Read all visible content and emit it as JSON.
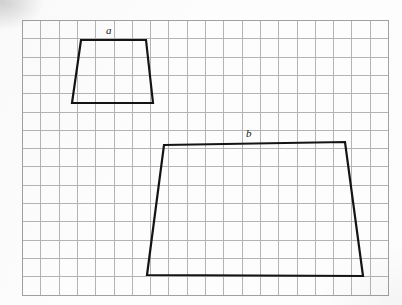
{
  "figure": {
    "background_color": "#fdfdfd",
    "grid": {
      "line_color": "#b4b4b4",
      "border_color": "#a0a0a0",
      "origin_x": 22,
      "origin_y": 20,
      "cell_size": 18.3,
      "columns": 20,
      "rows": 15
    },
    "stroke_color": "#141414",
    "stroke_width": 2.2,
    "shapes": [
      {
        "label": "a",
        "name": "small-trapezoid",
        "type": "trapezoid",
        "label_x": 106,
        "label_y": 25,
        "vertices_px": [
          [
            81,
            40
          ],
          [
            146,
            40
          ],
          [
            153,
            103
          ],
          [
            72,
            103
          ]
        ],
        "vertices_grid": [
          [
            3.2,
            1.1
          ],
          [
            6.8,
            1.1
          ],
          [
            7.2,
            4.5
          ],
          [
            2.7,
            4.5
          ]
        ],
        "top_width_units": 3.6,
        "bottom_width_units": 4.5,
        "height_units": 3.4
      },
      {
        "label": "b",
        "name": "large-trapezoid",
        "type": "trapezoid",
        "label_x": 246,
        "label_y": 128,
        "vertices_px": [
          [
            164,
            145
          ],
          [
            345,
            142
          ],
          [
            363,
            276
          ],
          [
            147,
            275
          ]
        ],
        "vertices_grid": [
          [
            7.8,
            6.8
          ],
          [
            17.7,
            6.7
          ],
          [
            18.6,
            14.0
          ],
          [
            6.8,
            13.9
          ]
        ],
        "top_width_units": 9.9,
        "bottom_width_units": 11.8,
        "height_units": 7.2
      }
    ]
  }
}
